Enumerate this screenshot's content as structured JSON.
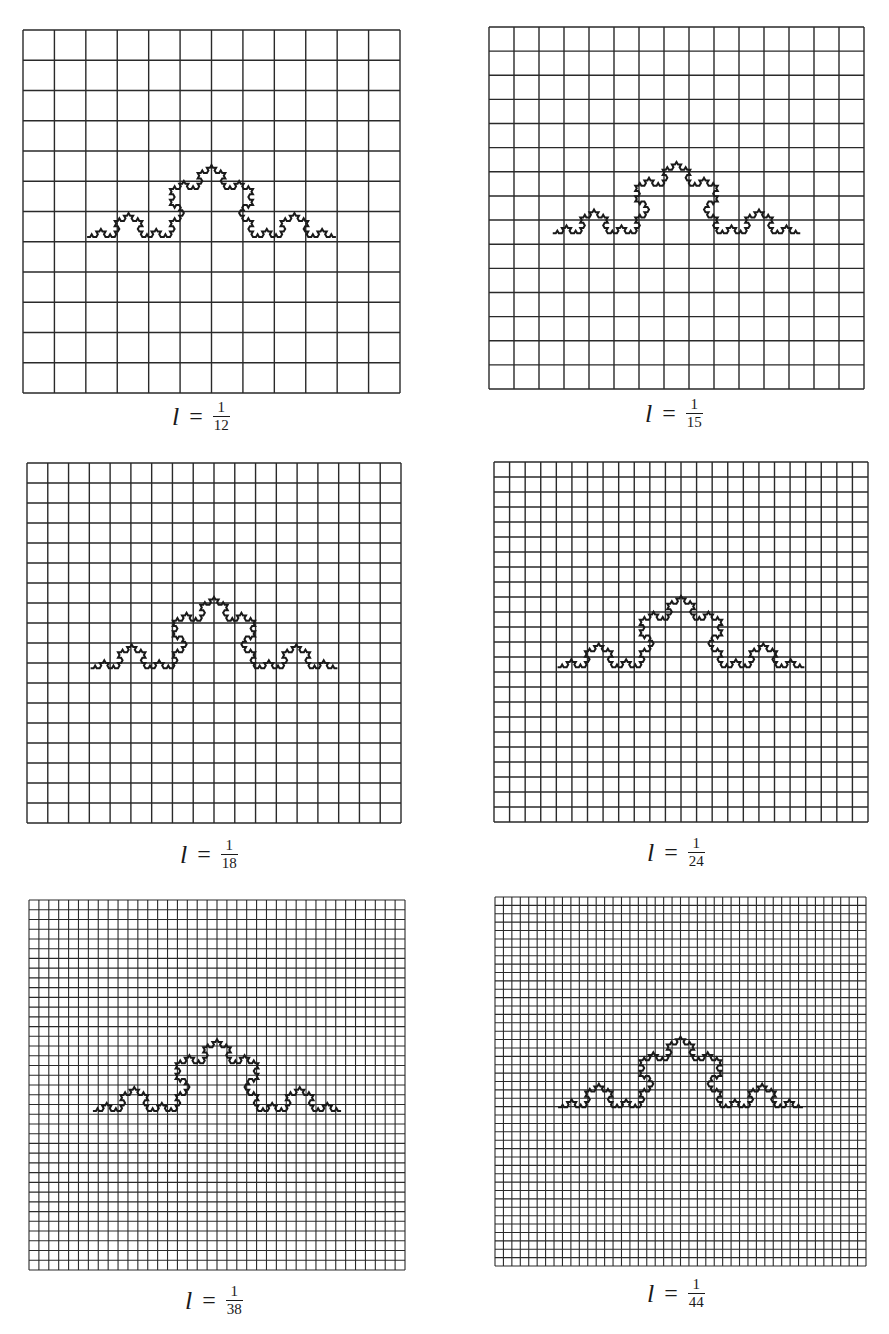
{
  "figure": {
    "grid_color": "#2a2a2a",
    "curve_color": "#1a1a1a",
    "curve_iterations": 4,
    "panels": [
      {
        "id": "p12",
        "grid_divisions": 12,
        "caption": {
          "variable": "l",
          "equals": "=",
          "numerator": "1",
          "denominator": "12"
        },
        "box": {
          "x": 23,
          "y": 30,
          "w": 377,
          "h": 363
        },
        "caption_pos": {
          "x": 172,
          "y": 400
        }
      },
      {
        "id": "p15",
        "grid_divisions": 15,
        "caption": {
          "variable": "l",
          "equals": "=",
          "numerator": "1",
          "denominator": "15"
        },
        "box": {
          "x": 489,
          "y": 27,
          "w": 375,
          "h": 362
        },
        "caption_pos": {
          "x": 645,
          "y": 397
        }
      },
      {
        "id": "p18",
        "grid_divisions": 18,
        "caption": {
          "variable": "l",
          "equals": "=",
          "numerator": "1",
          "denominator": "18"
        },
        "box": {
          "x": 27,
          "y": 463,
          "w": 374,
          "h": 360
        },
        "caption_pos": {
          "x": 180,
          "y": 838
        }
      },
      {
        "id": "p24",
        "grid_divisions": 24,
        "caption": {
          "variable": "l",
          "equals": "=",
          "numerator": "1",
          "denominator": "24"
        },
        "box": {
          "x": 494,
          "y": 462,
          "w": 374,
          "h": 360
        },
        "caption_pos": {
          "x": 647,
          "y": 836
        }
      },
      {
        "id": "p38",
        "grid_divisions": 38,
        "caption": {
          "variable": "l",
          "equals": "=",
          "numerator": "1",
          "denominator": "38"
        },
        "box": {
          "x": 29,
          "y": 900,
          "w": 376,
          "h": 370
        },
        "caption_pos": {
          "x": 185,
          "y": 1284
        }
      },
      {
        "id": "p44",
        "grid_divisions": 44,
        "caption": {
          "variable": "l",
          "equals": "=",
          "numerator": "1",
          "denominator": "44"
        },
        "box": {
          "x": 495,
          "y": 897,
          "w": 371,
          "h": 369
        },
        "caption_pos": {
          "x": 647,
          "y": 1277
        }
      }
    ],
    "curve_placement": {
      "x_start_frac": 0.17,
      "x_end_frac": 0.83,
      "baseline_y_frac": 0.57
    }
  }
}
